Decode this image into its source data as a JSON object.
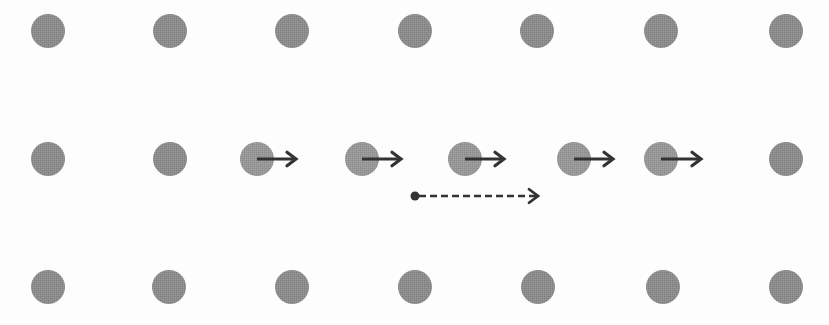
{
  "diagram": {
    "title": "",
    "colors": {
      "background": "#fdfdfd",
      "particle": "#8c8c8c",
      "arrow": "#333333"
    },
    "particle_radius": 17,
    "rows": [
      {
        "name": "top-row",
        "y": 31,
        "particles": [
          48,
          170,
          292,
          415,
          537,
          661,
          786
        ]
      },
      {
        "name": "middle-row",
        "y": 159,
        "particles": [
          48,
          170,
          257,
          362,
          465,
          574,
          661,
          786
        ],
        "displaced_indices": [
          2,
          3,
          4,
          5,
          6
        ]
      },
      {
        "name": "bottom-row",
        "y": 287,
        "particles": [
          48,
          169,
          292,
          415,
          538,
          663,
          786
        ]
      }
    ],
    "displacement_arrows": [
      {
        "x1": 257,
        "y": 159,
        "x2": 296
      },
      {
        "x1": 362,
        "y": 159,
        "x2": 401
      },
      {
        "x1": 465,
        "y": 159,
        "x2": 504
      },
      {
        "x1": 574,
        "y": 159,
        "x2": 613
      },
      {
        "x1": 661,
        "y": 159,
        "x2": 701
      }
    ],
    "propagation_arrow": {
      "x1": 415,
      "y": 196,
      "x2": 538,
      "style": "dashed",
      "start_marker": "dot"
    }
  }
}
